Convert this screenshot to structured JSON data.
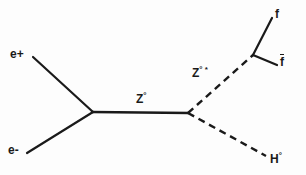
{
  "diagram": {
    "background_color": "#fdfdfd",
    "line_color": "#1a1a1a",
    "line_width": 2,
    "labels": {
      "positron": "e+",
      "electron": "e-",
      "z_boson": "Z",
      "z_boson_sup": "°",
      "z_boson_virtual": "Z",
      "z_boson_virtual_sup": "° *",
      "fermion": "f",
      "antifermion": "f",
      "higgs": "H",
      "higgs_sup": "°"
    },
    "vertices": {
      "left": {
        "x": 93,
        "y": 112
      },
      "right": {
        "x": 188,
        "y": 113
      },
      "fermion_split": {
        "x": 253,
        "y": 55
      }
    },
    "lines": [
      {
        "name": "positron-line",
        "style": "solid",
        "x1": 33,
        "y1": 57,
        "x2": 93,
        "y2": 112
      },
      {
        "name": "electron-line",
        "style": "solid",
        "x1": 27,
        "y1": 153,
        "x2": 93,
        "y2": 112
      },
      {
        "name": "z-propagator-line",
        "style": "solid",
        "x1": 93,
        "y1": 112,
        "x2": 188,
        "y2": 113
      },
      {
        "name": "z-virtual-line",
        "style": "dashed",
        "x1": 188,
        "y1": 113,
        "x2": 253,
        "y2": 55
      },
      {
        "name": "higgs-line",
        "style": "dashed",
        "x1": 188,
        "y1": 113,
        "x2": 266,
        "y2": 156
      },
      {
        "name": "fermion-line",
        "style": "solid",
        "x1": 253,
        "y1": 55,
        "x2": 272,
        "y2": 18
      },
      {
        "name": "antifermion-line",
        "style": "solid",
        "x1": 253,
        "y1": 55,
        "x2": 277,
        "y2": 65
      }
    ],
    "label_positions": {
      "positron": {
        "x": 10,
        "y": 48
      },
      "electron": {
        "x": 8,
        "y": 144
      },
      "z_boson": {
        "x": 136,
        "y": 92
      },
      "z_boson_virtual": {
        "x": 192,
        "y": 66
      },
      "fermion": {
        "x": 275,
        "y": 8
      },
      "antifermion": {
        "x": 280,
        "y": 54
      },
      "higgs": {
        "x": 270,
        "y": 152
      }
    }
  }
}
